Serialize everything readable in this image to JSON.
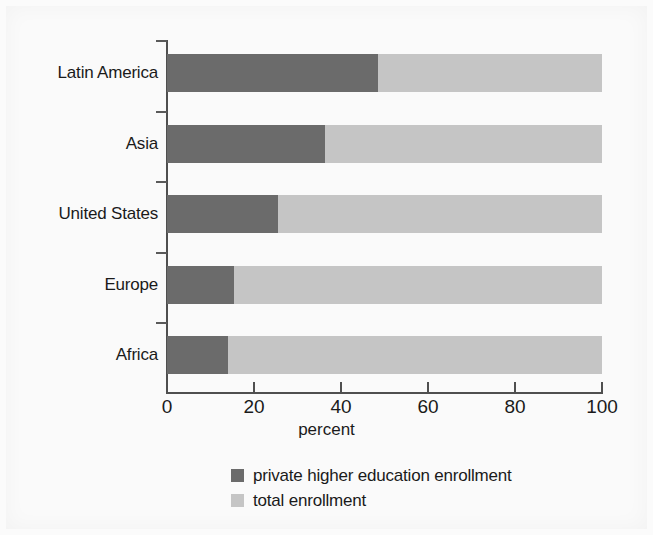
{
  "chart_data": {
    "type": "bar",
    "orientation": "horizontal",
    "stacked": true,
    "title": "",
    "xlabel": "percent",
    "ylabel": "",
    "xlim": [
      0,
      100
    ],
    "xticks": [
      0,
      20,
      40,
      60,
      80,
      100
    ],
    "xtick_labels": [
      "0",
      "20",
      "40",
      "60",
      "80",
      "100"
    ],
    "grid": false,
    "legend_position": "bottom-center",
    "categories": [
      "Latin America",
      "Asia",
      "United States",
      "Europe",
      "Africa"
    ],
    "series": [
      {
        "name": "private higher education enrollment",
        "color": "#6b6b6b",
        "values": [
          48.5,
          36.3,
          25.5,
          15.4,
          14.0
        ]
      },
      {
        "name": "total enrollment",
        "color": "#c5c5c5",
        "values": [
          51.5,
          63.7,
          74.5,
          84.6,
          86.0
        ]
      }
    ],
    "legend": [
      {
        "label": "private higher education enrollment",
        "color": "#6b6b6b"
      },
      {
        "label": "total enrollment",
        "color": "#c5c5c5"
      }
    ]
  },
  "colors": {
    "private": "#6b6b6b",
    "total": "#c5c5c5",
    "axis": "#4f4f4f",
    "text": "#1a1a1a",
    "background": "#fafafa"
  }
}
